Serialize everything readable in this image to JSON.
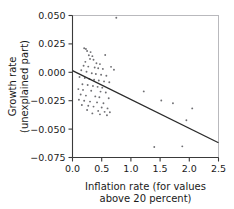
{
  "chart_data": {
    "type": "scatter",
    "title": "",
    "xlabel": "Inflation rate (for values above 20 percent)",
    "xlabel_line1": "Inflation rate (for values",
    "xlabel_line2": "above 20 percent)",
    "ylabel": "Growth rate (unexplained part)",
    "ylabel_line1": "Growth rate",
    "ylabel_line2": "(unexplained part)",
    "xlim": [
      0.0,
      2.5
    ],
    "ylim": [
      -0.075,
      0.05
    ],
    "xticks": [
      0.0,
      0.5,
      1.0,
      1.5,
      2.0,
      2.5
    ],
    "xtick_labels": [
      "0.0",
      "0.5",
      "1.0",
      "1.5",
      "2.0",
      "2.5"
    ],
    "yticks": [
      0.05,
      0.025,
      0.0,
      -0.025,
      -0.05,
      -0.075
    ],
    "ytick_labels": [
      "0.050",
      "0.025",
      "0.000",
      "−0.025",
      "−0.050",
      "−0.075"
    ],
    "grid": false,
    "legend": null,
    "marker_color": "#6f6f73",
    "line_color": "#2b2b2b",
    "axis_color": "#3a3a3a",
    "frame_color": "#b9b9bd",
    "background_color": "#ffffff",
    "fit_line": {
      "name": "fitted regression line",
      "x": [
        0.0,
        2.5
      ],
      "y": [
        0.0015,
        -0.062
      ],
      "intercept": 0.0015,
      "slope": -0.0254
    },
    "points": [
      {
        "x": 0.75,
        "y": 0.048
      },
      {
        "x": 0.2,
        "y": 0.0212
      },
      {
        "x": 0.23,
        "y": 0.0205
      },
      {
        "x": 0.25,
        "y": 0.0188
      },
      {
        "x": 0.31,
        "y": 0.0178
      },
      {
        "x": 0.28,
        "y": 0.015
      },
      {
        "x": 0.34,
        "y": 0.0142
      },
      {
        "x": 0.56,
        "y": 0.0152
      },
      {
        "x": 0.3,
        "y": 0.0118
      },
      {
        "x": 0.36,
        "y": 0.011
      },
      {
        "x": 0.22,
        "y": 0.0092
      },
      {
        "x": 0.41,
        "y": 0.008
      },
      {
        "x": 0.47,
        "y": 0.0072
      },
      {
        "x": 0.19,
        "y": 0.0058
      },
      {
        "x": 0.27,
        "y": 0.005
      },
      {
        "x": 0.38,
        "y": 0.0042
      },
      {
        "x": 0.44,
        "y": 0.0035
      },
      {
        "x": 0.52,
        "y": 0.003
      },
      {
        "x": 0.66,
        "y": 0.0048
      },
      {
        "x": 0.71,
        "y": 0.0022
      },
      {
        "x": 0.15,
        "y": 0.0018
      },
      {
        "x": 0.24,
        "y": 0.0005
      },
      {
        "x": 0.33,
        "y": -0.0008
      },
      {
        "x": 0.4,
        "y": -0.0015
      },
      {
        "x": 0.49,
        "y": -0.0022
      },
      {
        "x": 0.58,
        "y": -0.003
      },
      {
        "x": 0.12,
        "y": -0.0042
      },
      {
        "x": 0.21,
        "y": -0.005
      },
      {
        "x": 0.29,
        "y": -0.0058
      },
      {
        "x": 0.37,
        "y": -0.0065
      },
      {
        "x": 0.45,
        "y": -0.0072
      },
      {
        "x": 0.54,
        "y": -0.008
      },
      {
        "x": 0.63,
        "y": -0.0088
      },
      {
        "x": 0.17,
        "y": -0.0105
      },
      {
        "x": 0.26,
        "y": -0.0112
      },
      {
        "x": 0.35,
        "y": -0.012
      },
      {
        "x": 0.43,
        "y": -0.0128
      },
      {
        "x": 0.51,
        "y": -0.0135
      },
      {
        "x": 0.1,
        "y": -0.0148
      },
      {
        "x": 0.18,
        "y": -0.0155
      },
      {
        "x": 0.32,
        "y": -0.0162
      },
      {
        "x": 0.48,
        "y": -0.017
      },
      {
        "x": 0.57,
        "y": -0.0178
      },
      {
        "x": 0.14,
        "y": -0.0195
      },
      {
        "x": 0.23,
        "y": -0.0205
      },
      {
        "x": 0.39,
        "y": -0.0212
      },
      {
        "x": 0.46,
        "y": -0.022
      },
      {
        "x": 0.62,
        "y": -0.0228
      },
      {
        "x": 0.11,
        "y": -0.0242
      },
      {
        "x": 0.2,
        "y": -0.025
      },
      {
        "x": 0.3,
        "y": -0.0258
      },
      {
        "x": 0.42,
        "y": -0.0265
      },
      {
        "x": 0.53,
        "y": -0.0272
      },
      {
        "x": 0.16,
        "y": -0.0288
      },
      {
        "x": 0.27,
        "y": -0.0295
      },
      {
        "x": 0.36,
        "y": -0.0302
      },
      {
        "x": 0.5,
        "y": -0.031
      },
      {
        "x": 0.6,
        "y": -0.0318
      },
      {
        "x": 0.25,
        "y": -0.0332
      },
      {
        "x": 0.44,
        "y": -0.034
      },
      {
        "x": 0.55,
        "y": -0.0348
      },
      {
        "x": 0.34,
        "y": -0.0362
      },
      {
        "x": 0.47,
        "y": -0.037
      },
      {
        "x": 0.59,
        "y": -0.0378
      },
      {
        "x": 0.64,
        "y": -0.0352
      },
      {
        "x": 1.22,
        "y": -0.0168
      },
      {
        "x": 1.52,
        "y": -0.0248
      },
      {
        "x": 1.72,
        "y": -0.0272
      },
      {
        "x": 2.05,
        "y": -0.0318
      },
      {
        "x": 1.95,
        "y": -0.0422
      },
      {
        "x": 1.4,
        "y": -0.0658
      },
      {
        "x": 1.88,
        "y": -0.0652
      }
    ]
  }
}
